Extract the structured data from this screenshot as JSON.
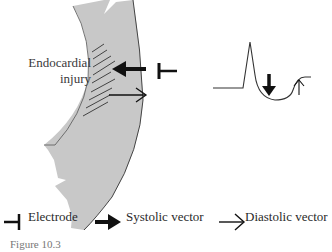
{
  "figure": {
    "labels": {
      "injury_line1": "Endocardial",
      "injury_line2": "injury"
    },
    "legend": [
      {
        "symbol": "electrode-icon",
        "label": "Electrode"
      },
      {
        "symbol": "systolic-vector-arrow-icon",
        "label": "Systolic vector"
      },
      {
        "symbol": "diastolic-vector-arrow-icon",
        "label": "Diastolic vector"
      }
    ],
    "caption": "Figure 10.3",
    "colors": {
      "wall_fill": "#c8c8c8",
      "wall_stroke": "#444444",
      "ink": "#111111"
    }
  }
}
